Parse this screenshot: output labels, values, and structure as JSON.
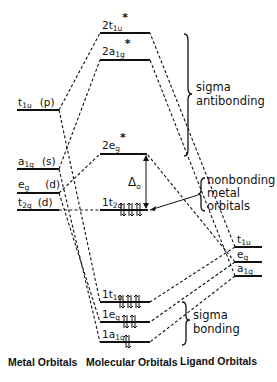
{
  "diagram": {
    "type": "molecular orbital energy-level diagram",
    "columns": {
      "metal": "Metal Orbitals",
      "molecular": "Molecular Orbitals",
      "ligand": "Ligand Orbitals"
    },
    "metal_orbitals": [
      {
        "sym": "t",
        "sub": "1u",
        "type": "(p)"
      },
      {
        "sym": "a",
        "sub": "1g",
        "type": "(s)"
      },
      {
        "sym": "e",
        "sub": "g",
        "type": "(d)"
      },
      {
        "sym": "t",
        "sub": "2g",
        "type": "(d)"
      }
    ],
    "molecular_orbitals": {
      "antibonding": [
        {
          "prefix": "2t",
          "sub": "1u",
          "star": "*"
        },
        {
          "prefix": "2a",
          "sub": "1g",
          "star": "*"
        },
        {
          "prefix": "2e",
          "sub": "g",
          "star": "*"
        }
      ],
      "nonbonding": {
        "prefix": "1t",
        "sub": "2g",
        "electrons": 6
      },
      "bonding": [
        {
          "prefix": "1t",
          "sub": "1u",
          "electrons": 6
        },
        {
          "prefix": "1e",
          "sub": "g",
          "electrons": 4
        },
        {
          "prefix": "1a",
          "sub": "1g",
          "electrons": 2
        }
      ]
    },
    "ligand_orbitals": [
      {
        "sym": "t",
        "sub": "1u"
      },
      {
        "sym": "e",
        "sub": "g"
      },
      {
        "sym": "a",
        "sub": "1g"
      }
    ],
    "splitting_label": "Δ",
    "splitting_sub": "o",
    "annotations": {
      "sigma_antibonding": [
        "sigma",
        "antibonding"
      ],
      "nonbonding": [
        "nonbonding",
        "metal",
        "orbitals"
      ],
      "sigma_bonding": [
        "sigma",
        "bonding"
      ]
    }
  }
}
